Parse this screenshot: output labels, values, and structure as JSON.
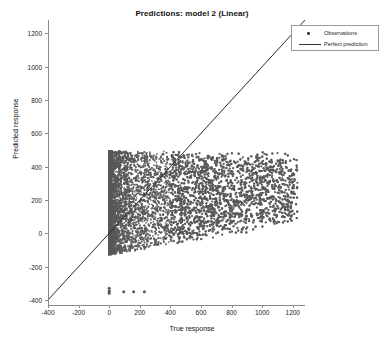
{
  "chart_data": {
    "type": "scatter",
    "title": "Predictions: model 2 (Linear)",
    "xlabel": "True response",
    "ylabel": "Predicted response",
    "xlim": [
      -400,
      1280
    ],
    "ylim": [
      -430,
      1280
    ],
    "xticks": [
      -400,
      -200,
      0,
      200,
      400,
      600,
      800,
      1000,
      1200
    ],
    "xticklabels": [
      "-400",
      "-200",
      "0",
      "200",
      "400",
      "600",
      "800",
      "1000",
      "1200"
    ],
    "yticks": [
      -400,
      -200,
      0,
      200,
      400,
      600,
      800,
      1000,
      1200
    ],
    "yticklabels": [
      "-400",
      "-200",
      "0",
      "200",
      "400",
      "600",
      "800",
      "1000",
      "1200"
    ],
    "grid": false,
    "legend_position": "top-right",
    "series": [
      {
        "name": "Observations",
        "type": "scatter",
        "marker": "circle",
        "color": "#595959",
        "point_count_approx": 9000,
        "cloud_description": "dense gray cloud with flat top at y=490 and a sharp vertical left edge at x=0, tapering to a sparse right tail out to x=1230",
        "x_range": [
          0,
          1230
        ],
        "y_range": [
          -130,
          495
        ],
        "sample_points": [
          [
            5,
            480
          ],
          [
            10,
            300
          ],
          [
            15,
            120
          ],
          [
            20,
            -20
          ],
          [
            30,
            420
          ],
          [
            45,
            260
          ],
          [
            60,
            100
          ],
          [
            80,
            470
          ],
          [
            110,
            330
          ],
          [
            140,
            180
          ],
          [
            170,
            40
          ],
          [
            200,
            460
          ],
          [
            240,
            350
          ],
          [
            280,
            240
          ],
          [
            320,
            130
          ],
          [
            360,
            30
          ],
          [
            400,
            470
          ],
          [
            450,
            370
          ],
          [
            500,
            280
          ],
          [
            550,
            190
          ],
          [
            600,
            110
          ],
          [
            650,
            450
          ],
          [
            700,
            360
          ],
          [
            750,
            270
          ],
          [
            800,
            180
          ],
          [
            850,
            90
          ],
          [
            900,
            400
          ],
          [
            950,
            320
          ],
          [
            1000,
            240
          ],
          [
            1050,
            170
          ],
          [
            1100,
            210
          ],
          [
            1150,
            260
          ],
          [
            1230,
            290
          ]
        ]
      },
      {
        "name": "Perfect prediction",
        "type": "line",
        "color": "#2b2b2b",
        "line": {
          "from": [
            -400,
            -400
          ],
          "to": [
            1280,
            1280
          ],
          "slope": 1,
          "intercept": 0
        }
      },
      {
        "name": "low outliers",
        "type": "scatter",
        "color": "#595959",
        "points": [
          [
            0,
            -330
          ],
          [
            0,
            -350
          ],
          [
            0,
            -360
          ],
          [
            0,
            -345
          ],
          [
            95,
            -350
          ],
          [
            160,
            -350
          ],
          [
            230,
            -350
          ]
        ]
      }
    ]
  },
  "legend": {
    "items": [
      {
        "label": "Observations",
        "key": "marker"
      },
      {
        "label": "Perfect prediction",
        "key": "line"
      }
    ]
  }
}
